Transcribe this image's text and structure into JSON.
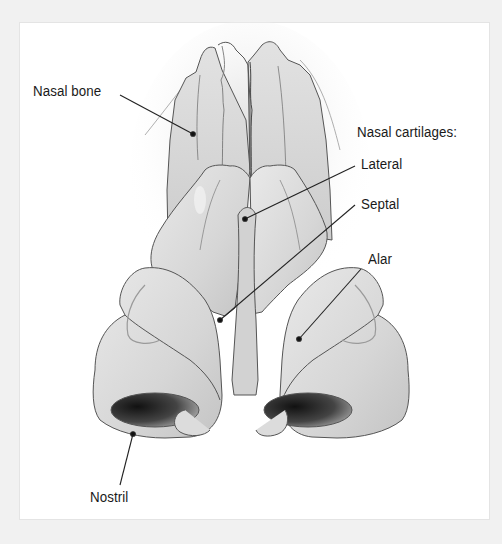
{
  "diagram": {
    "labels": {
      "nasal_bone": "Nasal bone",
      "cartilages_heading": "Nasal cartilages:",
      "lateral": "Lateral",
      "septal": "Septal",
      "alar": "Alar",
      "nostril": "Nostril"
    },
    "colors": {
      "background": "#f1f1f1",
      "panel": "#ffffff",
      "tissue": "#d9d9d9",
      "outline": "#4a4a4a",
      "nostril_dark": "#2a2a2a",
      "text": "#1a1a1a"
    }
  }
}
